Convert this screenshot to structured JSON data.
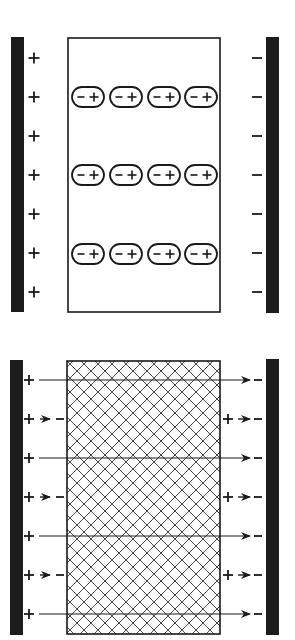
{
  "diagram": {
    "colors": {
      "ink": "#1a1a1a",
      "background": "#ffffff",
      "plate": "#1c1c1c"
    },
    "top_panel": {
      "left_plate_charge": "+",
      "right_plate_charge": "−",
      "left_charges": [
        "+",
        "+",
        "+",
        "+",
        "+",
        "+",
        "+"
      ],
      "right_charges": [
        "−",
        "−",
        "−",
        "−",
        "−",
        "−",
        "−"
      ],
      "dipole_rows": 3,
      "dipoles_per_row": 4,
      "dipole_label_neg": "−",
      "dipole_label_pos": "+"
    },
    "bottom_panel": {
      "dielectric_pattern": "crosshatch",
      "field_lines": 4,
      "partial_arrows_left": 3,
      "partial_arrows_right": 3,
      "plus": "+",
      "minus": "−"
    }
  }
}
